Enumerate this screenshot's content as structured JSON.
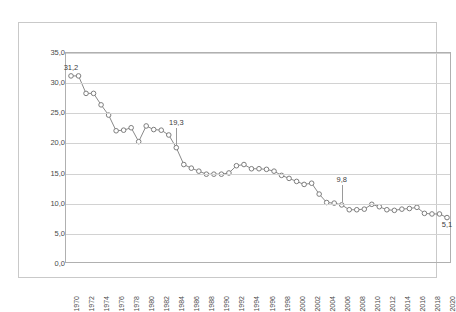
{
  "page": {
    "header_ghost_left": "",
    "header_ghost_right": ""
  },
  "chart_data": {
    "type": "line",
    "title": "",
    "subtitle": "",
    "xlabel": "",
    "ylabel": "",
    "ylim": [
      0.0,
      35.0
    ],
    "ytick_step": 5.0,
    "decimal_separator": ",",
    "grid": "horizontal",
    "legend": "none",
    "marker": "open-circle",
    "line_color": "#8a8a8a",
    "marker_color": "#7d7d7d",
    "grid_color": "#d2d2d2",
    "ytick_labels": [
      "35,0",
      "30,0",
      "25,0",
      "20,0",
      "15,0",
      "10,0",
      "5,0",
      "0,0"
    ],
    "ytick_values": [
      35.0,
      30.0,
      25.0,
      20.0,
      15.0,
      10.0,
      5.0,
      0.0
    ],
    "xtick_labels": [
      "1970",
      "1972",
      "1974",
      "1976",
      "1978",
      "1980",
      "1982",
      "1984",
      "1986",
      "1988",
      "1990",
      "1992",
      "1994",
      "1996",
      "1998",
      "2000",
      "2002",
      "2004",
      "2006",
      "2008",
      "2010",
      "2012",
      "2014",
      "2016",
      "2018",
      "2020"
    ],
    "x": [
      1970,
      1971,
      1972,
      1973,
      1974,
      1975,
      1976,
      1977,
      1978,
      1979,
      1980,
      1981,
      1982,
      1983,
      1984,
      1985,
      1986,
      1987,
      1988,
      1989,
      1990,
      1991,
      1992,
      1993,
      1994,
      1995,
      1996,
      1997,
      1998,
      1999,
      2000,
      2001,
      2002,
      2003,
      2004,
      2005,
      2006,
      2007,
      2008,
      2009,
      2010,
      2011,
      2012,
      2013,
      2014,
      2015,
      2016,
      2017,
      2018,
      2019,
      2020
    ],
    "values": [
      31.2,
      31.2,
      28.3,
      28.3,
      26.4,
      24.7,
      22.1,
      22.2,
      22.6,
      20.3,
      22.9,
      22.3,
      22.2,
      21.4,
      19.3,
      16.5,
      15.9,
      15.4,
      14.9,
      14.9,
      14.9,
      15.1,
      16.3,
      16.5,
      15.8,
      15.8,
      15.7,
      15.4,
      14.7,
      14.2,
      13.7,
      13.2,
      13.4,
      11.6,
      10.2,
      10.1,
      9.8,
      9.0,
      9.0,
      9.1,
      9.9,
      9.5,
      9.0,
      8.9,
      9.1,
      9.2,
      9.4,
      8.4,
      8.3,
      8.3,
      7.7
    ],
    "annotations": [
      {
        "label": "31,2",
        "x_index": 0,
        "value": 31.2,
        "leader": false
      },
      {
        "label": "19,3",
        "x_index": 14,
        "value": 19.3,
        "leader": true
      },
      {
        "label": "9,8",
        "x_index": 36,
        "value": 9.8,
        "leader": true
      },
      {
        "label": "5,1",
        "x_index": 50,
        "value": 5.1,
        "leader": false
      }
    ],
    "first_value_label": "31,2",
    "last_value_label": "5,1"
  }
}
